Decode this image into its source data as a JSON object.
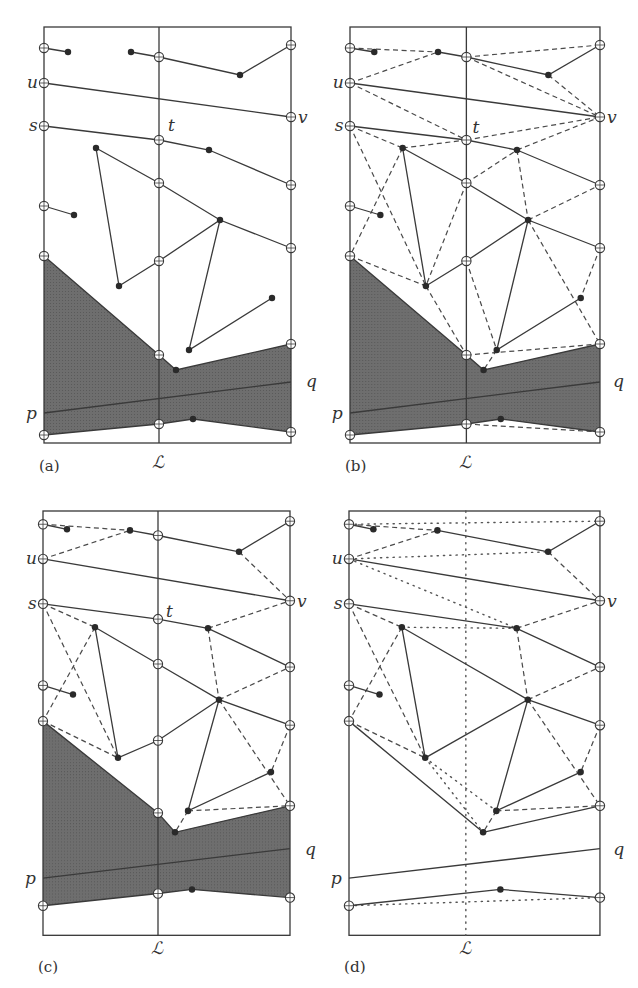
{
  "figure": {
    "panels": [
      {
        "id": "a",
        "caption": "(a)",
        "origin": [
          44,
          27
        ],
        "scale": [
          1.0,
          1.0
        ],
        "shaded": true,
        "stage": "input"
      },
      {
        "id": "b",
        "caption": "(b)",
        "origin": [
          350,
          27
        ],
        "scale": [
          1.012,
          1.0
        ],
        "shaded": true,
        "stage": "full-triangulation"
      },
      {
        "id": "c",
        "caption": "(c)",
        "origin": [
          43,
          511
        ],
        "scale": [
          1.0,
          1.02
        ],
        "shaded": true,
        "stage": "partial-triangulation"
      },
      {
        "id": "d",
        "caption": "(d)",
        "origin": [
          349,
          511
        ],
        "scale": [
          1.016,
          1.02
        ],
        "shaded": false,
        "stage": "after-deletion"
      }
    ],
    "labels": {
      "u": "u",
      "v": "v",
      "s": "s",
      "t": "t",
      "p": "p",
      "q": "q",
      "line": "ℒ"
    }
  }
}
